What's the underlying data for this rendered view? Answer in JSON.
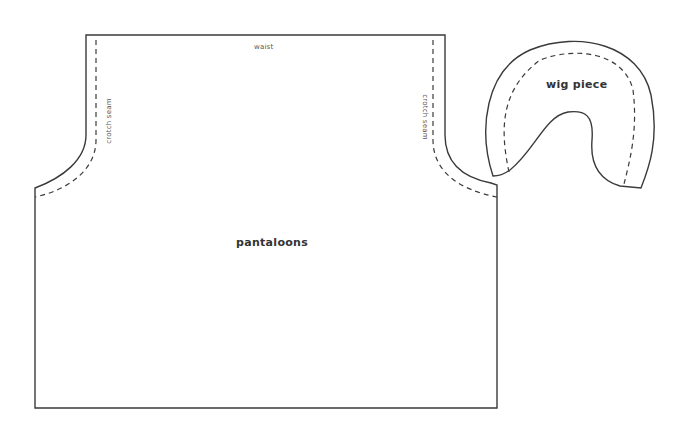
{
  "document": {
    "type": "sewing-pattern",
    "background_color": "#ffffff",
    "line_color": "#3a3a3a"
  },
  "pieces": {
    "pantaloons": {
      "label": "pantaloons",
      "annotations": {
        "waist": "waist",
        "left_seam": "crotch seam",
        "right_seam": "crotch seam"
      }
    },
    "wig_piece": {
      "label": "wig piece"
    }
  }
}
